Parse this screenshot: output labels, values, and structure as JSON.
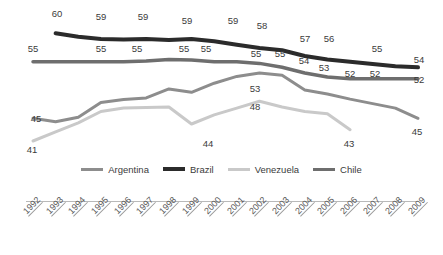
{
  "chart_data": {
    "type": "line",
    "title": "",
    "subtitle": "",
    "xlabel": "",
    "ylabel": "",
    "ylim": [
      38,
      62
    ],
    "grid": false,
    "legend_position": "bottom-center",
    "categories": [
      "1992",
      "1993",
      "1994",
      "1995",
      "1996",
      "1997",
      "1998",
      "1999",
      "2000",
      "2001",
      "2002",
      "2003",
      "2004",
      "2005",
      "2006",
      "2007",
      "2008",
      "2009"
    ],
    "series": [
      {
        "name": "Argentina",
        "color": "#8d8d8d",
        "values": [
          45,
          44.4,
          45.2,
          47.8,
          48.3,
          48.6,
          50.2,
          49.6,
          51.2,
          52.4,
          53,
          52.6,
          50,
          49.3,
          48.4,
          47.6,
          46.8,
          45
        ],
        "labels": {
          "1992": "45",
          "2002": "53",
          "2009": "45"
        }
      },
      {
        "name": "Brazil",
        "color": "#2b2b2b",
        "values": [
          null,
          60,
          59.4,
          59,
          58.9,
          59,
          58.8,
          59,
          58.6,
          58,
          57.4,
          57,
          56,
          55.4,
          55,
          54.6,
          54.2,
          54
        ],
        "labels": {
          "1993": "60",
          "1994": "59",
          "1996": "59",
          "1998": "59",
          "2000": "59",
          "2001": "58",
          "2003": "57",
          "2004": "56",
          "2007": "55",
          "2009": "54"
        }
      },
      {
        "name": "Venezuela",
        "color": "#c9c9c9",
        "values": [
          41,
          42.6,
          44.2,
          46.2,
          46.8,
          46.9,
          47,
          44,
          45.6,
          46.8,
          48,
          47,
          46.2,
          45.8,
          43,
          null,
          null,
          null
        ],
        "labels": {
          "1992": "41",
          "1999": "44",
          "2002": "48",
          "2006": "43"
        }
      },
      {
        "name": "Chile",
        "color": "#6e6e6e",
        "values": [
          55,
          55,
          55,
          55,
          55,
          55.1,
          55.4,
          55.3,
          55,
          55,
          54.7,
          54,
          53,
          52.3,
          52,
          52,
          52,
          52
        ],
        "labels": {
          "1992": "55",
          "1995": "55",
          "1996": "55",
          "1998": "55",
          "1999": "55",
          "2002": "55",
          "2003": "55",
          "2004": "54",
          "2005": "53",
          "2006": "52",
          "2007": "52",
          "2009": "52"
        }
      }
    ],
    "value_labels": [
      {
        "series": "Brazil",
        "text": "60",
        "x": 57,
        "y": 17
      },
      {
        "series": "Brazil",
        "text": "59",
        "x": 101,
        "y": 20
      },
      {
        "series": "Brazil",
        "text": "59",
        "x": 143,
        "y": 20
      },
      {
        "series": "Brazil",
        "text": "59",
        "x": 187,
        "y": 24
      },
      {
        "series": "Brazil",
        "text": "59",
        "x": 233,
        "y": 24
      },
      {
        "series": "Brazil",
        "text": "58",
        "x": 262,
        "y": 29
      },
      {
        "series": "Brazil",
        "text": "57",
        "x": 305,
        "y": 42
      },
      {
        "series": "Brazil",
        "text": "56",
        "x": 329,
        "y": 42
      },
      {
        "series": "Brazil",
        "text": "55",
        "x": 377,
        "y": 52
      },
      {
        "series": "Brazil",
        "text": "54",
        "x": 419,
        "y": 63
      },
      {
        "series": "Chile",
        "text": "55",
        "x": 33,
        "y": 52
      },
      {
        "series": "Chile",
        "text": "55",
        "x": 101,
        "y": 52
      },
      {
        "series": "Chile",
        "text": "55",
        "x": 137,
        "y": 52
      },
      {
        "series": "Chile",
        "text": "55",
        "x": 184,
        "y": 52
      },
      {
        "series": "Chile",
        "text": "55",
        "x": 206,
        "y": 52
      },
      {
        "series": "Chile",
        "text": "55",
        "x": 256,
        "y": 57
      },
      {
        "series": "Chile",
        "text": "55",
        "x": 280,
        "y": 57
      },
      {
        "series": "Chile",
        "text": "54",
        "x": 304,
        "y": 64
      },
      {
        "series": "Chile",
        "text": "53",
        "x": 324,
        "y": 71
      },
      {
        "series": "Chile",
        "text": "52",
        "x": 350,
        "y": 77
      },
      {
        "series": "Chile",
        "text": "52",
        "x": 375,
        "y": 77
      },
      {
        "series": "Chile",
        "text": "52",
        "x": 419,
        "y": 83
      },
      {
        "series": "Argentina",
        "text": "45",
        "x": 36,
        "y": 122
      },
      {
        "series": "Argentina",
        "text": "53",
        "x": 255,
        "y": 92
      },
      {
        "series": "Argentina",
        "text": "45",
        "x": 417,
        "y": 135
      },
      {
        "series": "Venezuela",
        "text": "41",
        "x": 32,
        "y": 153
      },
      {
        "series": "Venezuela",
        "text": "44",
        "x": 208,
        "y": 147
      },
      {
        "series": "Venezuela",
        "text": "48",
        "x": 255,
        "y": 110
      },
      {
        "series": "Venezuela",
        "text": "43",
        "x": 349,
        "y": 147
      }
    ]
  },
  "legend": {
    "items": [
      {
        "label": "Argentina",
        "color": "#8d8d8d",
        "width": 3
      },
      {
        "label": "Brazil",
        "color": "#2b2b2b",
        "width": 4
      },
      {
        "label": "Venezuela",
        "color": "#c9c9c9",
        "width": 3
      },
      {
        "label": "Chile",
        "color": "#6e6e6e",
        "width": 3.5
      }
    ]
  },
  "axis": {
    "ticks": [
      "1992",
      "1993",
      "1994",
      "1995",
      "1996",
      "1997",
      "1998",
      "1999",
      "2000",
      "2001",
      "2002",
      "2003",
      "2004",
      "2005",
      "2006",
      "2007",
      "2008",
      "2009"
    ]
  }
}
